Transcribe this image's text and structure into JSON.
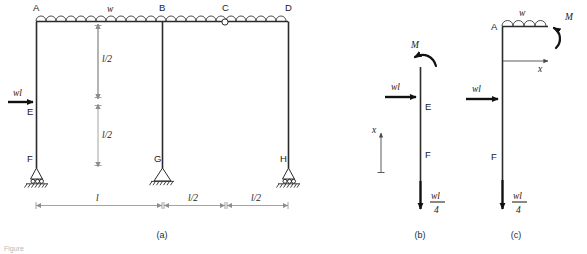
{
  "figure": {
    "caption_a": "(a)",
    "caption_b": "(b)",
    "caption_c": "(c)",
    "bottom_caption": "Figure",
    "colors": {
      "member": "#2b2b2b",
      "dimension": "#8c8c8c",
      "force": "#111111",
      "background": "#ffffff",
      "caption": "#b9b9b9"
    }
  },
  "panel_a": {
    "label": "(a)",
    "nodes": {
      "A": "A",
      "B": "B",
      "C": "C",
      "D": "D",
      "E": "E",
      "F": "F",
      "G": "G",
      "H": "H"
    },
    "loads": {
      "distributed": "w",
      "point_horizontal": "wl"
    },
    "dimensions": {
      "vertical_upper": "l/2",
      "vertical_lower": "l/2",
      "horizontal_left": "l",
      "horizontal_mid": "l/2",
      "horizontal_right": "l/2"
    },
    "supports": {
      "F": "roller-support",
      "G": "pinned-support",
      "H": "roller-support"
    },
    "hinge": "C"
  },
  "panel_b": {
    "label": "(b)",
    "nodes": {
      "E": "E",
      "F": "F"
    },
    "moment": "M",
    "force_horizontal": "wl",
    "axis": "x",
    "reaction_numerator": "wl",
    "reaction_denominator": "4"
  },
  "panel_c": {
    "label": "(c)",
    "nodes": {
      "A": "A",
      "F": "F"
    },
    "distributed_load": "w",
    "moment": "M",
    "axis": "x",
    "force_horizontal": "wl",
    "reaction_numerator": "wl",
    "reaction_denominator": "4"
  }
}
